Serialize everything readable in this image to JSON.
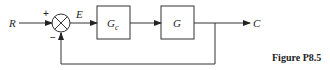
{
  "diagram": {
    "type": "block-diagram",
    "input_label": "R",
    "output_label": "C",
    "error_label": "E",
    "summing_junction": {
      "plus_sign": "+",
      "minus_sign": "−"
    },
    "blocks": [
      {
        "id": "controller",
        "label": "G",
        "subscript": "c"
      },
      {
        "id": "plant",
        "label": "G",
        "subscript": ""
      }
    ],
    "feedback": "unity negative feedback"
  },
  "caption": "Figure P8.5"
}
